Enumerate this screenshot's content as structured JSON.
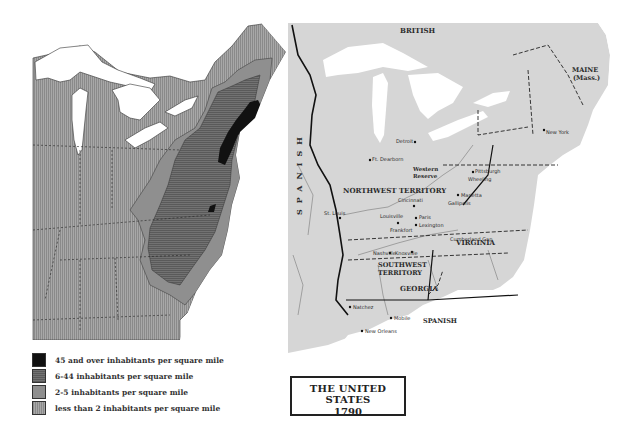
{
  "left_map": {
    "description": "Population density of the eastern United States, 1790",
    "colors": {
      "density_45_plus": "#111111",
      "density_6_44": "#6b6b6b",
      "density_2_5": "#8f8f8f",
      "density_less_2": "#a3a3a3",
      "water": "#ffffff"
    }
  },
  "legend": {
    "items": [
      {
        "label": "45 and over inhabitants per square mile",
        "color": "#111111",
        "pattern": "solid"
      },
      {
        "label": "6-44 inhabitants per square mile",
        "color": "#6b6b6b",
        "pattern": "horizontal-hatch"
      },
      {
        "label": "2-5  inhabitants per square mile",
        "color": "#8f8f8f",
        "pattern": "solid"
      },
      {
        "label": "less than 2 inhabitants per square mile",
        "color": "#a3a3a3",
        "pattern": "vertical-hatch"
      }
    ]
  },
  "right_map": {
    "background": "#d6d6d6",
    "regions": {
      "british": "BRITISH",
      "spanish_west": "SPANISH",
      "spanish_south": "SPANISH",
      "northwest_territory": "NORTHWEST TERRITORY",
      "southwest_territory_line1": "SOUTHWEST",
      "southwest_territory_line2": "TERRITORY",
      "georgia": "GEORGIA",
      "virginia": "VIRGINIA",
      "maine_line1": "MAINE",
      "maine_line2": "(Mass.)",
      "western_reserve_line1": "Western",
      "western_reserve_line2": "Reserve",
      "seven_ranges": "Seven Ranges"
    },
    "cities": [
      {
        "name": "Detroit"
      },
      {
        "name": "Ft. Dearborn"
      },
      {
        "name": "Pittsburgh"
      },
      {
        "name": "Wheeling"
      },
      {
        "name": "Marietta"
      },
      {
        "name": "Gallipolis"
      },
      {
        "name": "Cincinnati"
      },
      {
        "name": "Louisville"
      },
      {
        "name": "Paris"
      },
      {
        "name": "Lexington"
      },
      {
        "name": "Frankfort"
      },
      {
        "name": "St. Louis"
      },
      {
        "name": "Nashville"
      },
      {
        "name": "Knoxville"
      },
      {
        "name": "Cumberland Gap"
      },
      {
        "name": "New York"
      },
      {
        "name": "Natchez"
      },
      {
        "name": "Mobile"
      },
      {
        "name": "New Orleans"
      }
    ]
  },
  "title_box": {
    "line1": "THE UNITED STATES",
    "line2": "1790"
  }
}
